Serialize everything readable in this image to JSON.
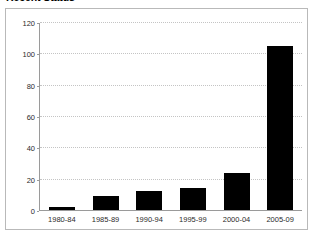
{
  "chart_data": {
    "type": "bar",
    "title": "Recent Status",
    "xlabel": "",
    "ylabel": "",
    "categories": [
      "1980-84",
      "1985-89",
      "1990-94",
      "1995-99",
      "2000-04",
      "2005-09"
    ],
    "values": [
      2,
      9,
      12,
      14,
      24,
      105
    ],
    "series": [
      {
        "name": "Count",
        "values": [
          2,
          9,
          12,
          14,
          24,
          105
        ]
      }
    ],
    "ylim": [
      0,
      120
    ],
    "yticks": [
      0,
      20,
      40,
      60,
      80,
      100,
      120
    ],
    "ytick_labels": [
      "0",
      "20",
      "40",
      "60",
      "80",
      "100",
      "120"
    ],
    "grid": "horizontal-dotted",
    "legend": "none",
    "bar_color": "#000000",
    "axis_color": "#9a9a9a",
    "gridline_color": "#c4c4c4",
    "frame_color": "#b9b9b9",
    "background_color": "#ffffff"
  }
}
